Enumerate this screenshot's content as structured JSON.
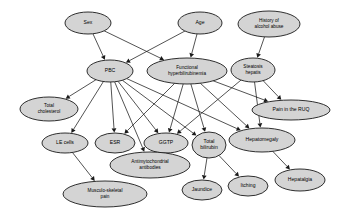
{
  "diagram": {
    "type": "directed-acyclic-graph",
    "node_fill_color": "#d4d4d4",
    "node_stroke_color": "#1a1a1a",
    "edge_color": "#1a1a1a",
    "background_color": "#ffffff",
    "nodes": [
      {
        "id": "sex",
        "label": "Sex",
        "lines": [
          "Sex"
        ],
        "cx": 88,
        "cy": 23,
        "rx": 23,
        "ry": 11
      },
      {
        "id": "age",
        "label": "Age",
        "lines": [
          "Age"
        ],
        "cx": 200,
        "cy": 23,
        "rx": 22,
        "ry": 11
      },
      {
        "id": "alcohol",
        "label": "History of alcohol abuse",
        "lines": [
          "History of",
          "alcohol abuse"
        ],
        "cx": 269,
        "cy": 24,
        "rx": 31,
        "ry": 13
      },
      {
        "id": "pbc",
        "label": "PBC",
        "lines": [
          "PBC"
        ],
        "cx": 110,
        "cy": 71,
        "rx": 23,
        "ry": 11
      },
      {
        "id": "fhb",
        "label": "Functional hyperbilirubinemia",
        "lines": [
          "Functional",
          "hyperbilirubinemia"
        ],
        "cx": 187,
        "cy": 71,
        "rx": 40,
        "ry": 13
      },
      {
        "id": "steatosis",
        "label": "Steatosis hepatis",
        "lines": [
          "Steatosis",
          "hepatis"
        ],
        "cx": 253,
        "cy": 70,
        "rx": 22,
        "ry": 12
      },
      {
        "id": "cholesterol",
        "label": "Total cholesterol",
        "lines": [
          "Total",
          "cholesterol"
        ],
        "cx": 49,
        "cy": 109,
        "rx": 29,
        "ry": 12
      },
      {
        "id": "ruq",
        "label": "Pain in the RUQ",
        "lines": [
          "Pain in the RUQ"
        ],
        "cx": 291,
        "cy": 110,
        "rx": 39,
        "ry": 10
      },
      {
        "id": "lecells",
        "label": "LE cells",
        "lines": [
          "LE cells"
        ],
        "cx": 65,
        "cy": 143,
        "rx": 23,
        "ry": 10
      },
      {
        "id": "esr",
        "label": "ESR",
        "lines": [
          "ESR"
        ],
        "cx": 115,
        "cy": 143,
        "rx": 20,
        "ry": 10
      },
      {
        "id": "ggtp",
        "label": "GGTP",
        "lines": [
          "GGTP"
        ],
        "cx": 166,
        "cy": 143,
        "rx": 22,
        "ry": 10
      },
      {
        "id": "bilirubin",
        "label": "Total bilirubin",
        "lines": [
          "Total",
          "bilirubin"
        ],
        "cx": 209,
        "cy": 145,
        "rx": 17,
        "ry": 13
      },
      {
        "id": "hepatomeg",
        "label": "Hepatomegaly",
        "lines": [
          "Hepatomegaly"
        ],
        "cx": 262,
        "cy": 140,
        "rx": 33,
        "ry": 12
      },
      {
        "id": "ama",
        "label": "Antimytochondrial antibodies",
        "lines": [
          "Antimytochondrial",
          "antibodies"
        ],
        "cx": 150,
        "cy": 165,
        "rx": 40,
        "ry": 13
      },
      {
        "id": "msp",
        "label": "Musculo-skeletal pain",
        "lines": [
          "Musculo-skeletal",
          "pain"
        ],
        "cx": 105,
        "cy": 194,
        "rx": 42,
        "ry": 13
      },
      {
        "id": "jaundice",
        "label": "Jaundice",
        "lines": [
          "Jaundice"
        ],
        "cx": 202,
        "cy": 190,
        "rx": 20,
        "ry": 10
      },
      {
        "id": "itching",
        "label": "Itching",
        "lines": [
          "Itching"
        ],
        "cx": 248,
        "cy": 186,
        "rx": 20,
        "ry": 10
      },
      {
        "id": "hepatalgia",
        "label": "Hepatalgia",
        "lines": [
          "Hepatalgia"
        ],
        "cx": 300,
        "cy": 180,
        "rx": 25,
        "ry": 11
      }
    ],
    "edges": [
      {
        "from": "sex",
        "to": "pbc"
      },
      {
        "from": "sex",
        "to": "fhb"
      },
      {
        "from": "age",
        "to": "pbc"
      },
      {
        "from": "age",
        "to": "fhb"
      },
      {
        "from": "alcohol",
        "to": "steatosis"
      },
      {
        "from": "pbc",
        "to": "cholesterol"
      },
      {
        "from": "pbc",
        "to": "lecells"
      },
      {
        "from": "pbc",
        "to": "esr"
      },
      {
        "from": "pbc",
        "to": "ggtp"
      },
      {
        "from": "pbc",
        "to": "ama"
      },
      {
        "from": "pbc",
        "to": "bilirubin"
      },
      {
        "from": "pbc",
        "to": "hepatomegaly_via_pbc"
      },
      {
        "from": "fhb",
        "to": "esr"
      },
      {
        "from": "fhb",
        "to": "ggtp"
      },
      {
        "from": "fhb",
        "to": "bilirubin"
      },
      {
        "from": "fhb",
        "to": "ruq"
      },
      {
        "from": "fhb",
        "to": "hepatomeg"
      },
      {
        "from": "steatosis",
        "to": "ggtp"
      },
      {
        "from": "steatosis",
        "to": "ruq"
      },
      {
        "from": "steatosis",
        "to": "hepatomeg"
      },
      {
        "from": "lecells",
        "to": "msp"
      },
      {
        "from": "ggtp",
        "to": "ama"
      },
      {
        "from": "bilirubin",
        "to": "jaundice"
      },
      {
        "from": "bilirubin",
        "to": "itching"
      },
      {
        "from": "hepatomeg",
        "to": "hepatalgia"
      }
    ]
  }
}
